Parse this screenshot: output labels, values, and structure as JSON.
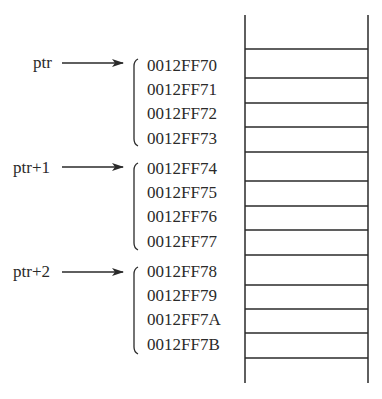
{
  "diagram": {
    "title": "",
    "colors": {
      "ink": "#2a2a2a",
      "background": "#ffffff"
    },
    "memory_column": {
      "x_left": 245,
      "x_right": 368,
      "y_top": 15,
      "y_bottom": 383,
      "cell_lines_y": [
        49,
        78,
        103,
        127,
        152,
        181,
        206,
        230,
        255,
        285,
        309,
        333,
        358
      ]
    },
    "groups": [
      {
        "pointer_label": "ptr",
        "addresses": [
          "0012FF70",
          "0012FF71",
          "0012FF72",
          "0012FF73"
        ]
      },
      {
        "pointer_label": "ptr+1",
        "addresses": [
          "0012FF74",
          "0012FF75",
          "0012FF76",
          "0012FF77"
        ]
      },
      {
        "pointer_label": "ptr+2",
        "addresses": [
          "0012FF78",
          "0012FF79",
          "0012FF7A",
          "0012FF7B"
        ]
      }
    ]
  }
}
